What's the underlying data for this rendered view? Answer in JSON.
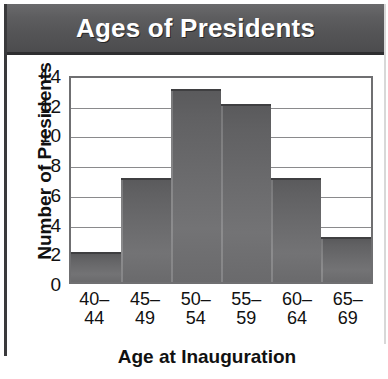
{
  "banner": {
    "title": "Ages of Presidents"
  },
  "chart_data": {
    "type": "bar",
    "title": "Ages of Presidents",
    "xlabel": "Age at Inauguration",
    "ylabel": "Number of Presidents",
    "categories": [
      "40–44",
      "45–49",
      "50–54",
      "55–59",
      "60–64",
      "65–69"
    ],
    "category_lines": [
      [
        "40–",
        "44"
      ],
      [
        "45–",
        "49"
      ],
      [
        "50–",
        "54"
      ],
      [
        "55–",
        "59"
      ],
      [
        "60–",
        "64"
      ],
      [
        "65–",
        "69"
      ]
    ],
    "values": [
      2,
      7,
      13,
      12,
      7,
      3
    ],
    "ylim": [
      0,
      14
    ],
    "ytick_labels": [
      "14",
      "12",
      "10",
      "8",
      "6",
      "4",
      "2",
      "0"
    ],
    "ytick_values": [
      14,
      12,
      10,
      8,
      6,
      4,
      2,
      0
    ],
    "grid": true,
    "legend": false,
    "bar_color": "#6b6b6d",
    "bar_edge_color": "#3f3f41",
    "banner_color": "#57575a",
    "axis_text_color": "#111111"
  }
}
